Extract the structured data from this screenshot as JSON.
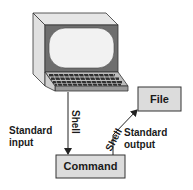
{
  "diagram": {
    "terminal": {
      "name": "terminal-computer"
    },
    "shell_in_label": "Shell",
    "shell_out_label": "Shell",
    "standard_input": {
      "line1": "Standard",
      "line2": "input"
    },
    "standard_output": {
      "line1": "Standard",
      "line2": "output"
    },
    "command_box": {
      "label": "Command"
    },
    "file_box": {
      "label": "File"
    },
    "colors": {
      "box_fill": "#dcdcdc",
      "stroke": "#333333",
      "monitor_body": "#d9d9d9",
      "screen_bezel": "#6e6e6e",
      "screen": "#f2f2f2",
      "keyboard": "#3a3a3a"
    }
  }
}
